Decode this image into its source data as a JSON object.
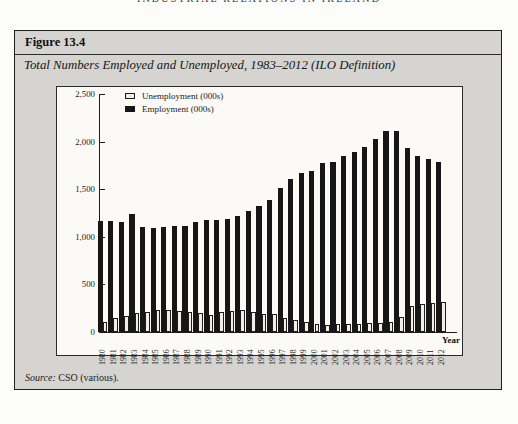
{
  "page": {
    "running_header": "INDUSTRIAL RELATIONS IN IRELAND",
    "figure_label": "Figure 13.4",
    "figure_title": "Total Numbers Employed and Unemployed, 1983–2012  (ILO Definition)",
    "source": {
      "prefix": "Source:",
      "text": " CSO (various)."
    }
  },
  "chart_data": {
    "type": "bar",
    "title": "Total Numbers Employed and Unemployed, 1983–2012 (ILO Definition)",
    "xlabel": "Year",
    "ylabel": "",
    "ylim": [
      0,
      2500
    ],
    "grid": false,
    "legend_position": "top-left",
    "yticks": [
      {
        "value": 0,
        "label": "0"
      },
      {
        "value": 500,
        "label": "500"
      },
      {
        "value": 1000,
        "label": "1,000"
      },
      {
        "value": 1500,
        "label": "1,500"
      },
      {
        "value": 2000,
        "label": "2,000"
      },
      {
        "value": 2500,
        "label": "2,500"
      }
    ],
    "categories": [
      "1980",
      "1981",
      "1982",
      "1983",
      "1984",
      "1985",
      "1986",
      "1987",
      "1988",
      "1989",
      "1990",
      "1991",
      "1992",
      "1993",
      "1994",
      "1995",
      "1996",
      "1997",
      "1998",
      "1999",
      "2000",
      "2001",
      "2002",
      "2003",
      "2004",
      "2005",
      "2006",
      "2007",
      "2008",
      "2009",
      "2010",
      "2011",
      "2012"
    ],
    "series": [
      {
        "id": "unemployment",
        "name": "Unemployment (000s)",
        "color": "#efeeea",
        "border_color": "#1d1d1d",
        "values": [
          110,
          145,
          170,
          195,
          215,
          228,
          228,
          222,
          215,
          195,
          180,
          205,
          222,
          228,
          215,
          188,
          188,
          150,
          125,
          100,
          82,
          75,
          82,
          87,
          87,
          92,
          95,
          110,
          160,
          270,
          295,
          305,
          315
        ]
      },
      {
        "id": "employment",
        "name": "Employment (000s)",
        "color": "#161616",
        "border_color": "#161616",
        "values": [
          1170,
          1165,
          1160,
          1240,
          1105,
          1095,
          1105,
          1110,
          1115,
          1160,
          1175,
          1175,
          1190,
          1220,
          1270,
          1320,
          1390,
          1510,
          1610,
          1675,
          1690,
          1770,
          1790,
          1845,
          1895,
          1945,
          2030,
          2115,
          2110,
          1935,
          1850,
          1820,
          1785
        ]
      }
    ]
  }
}
